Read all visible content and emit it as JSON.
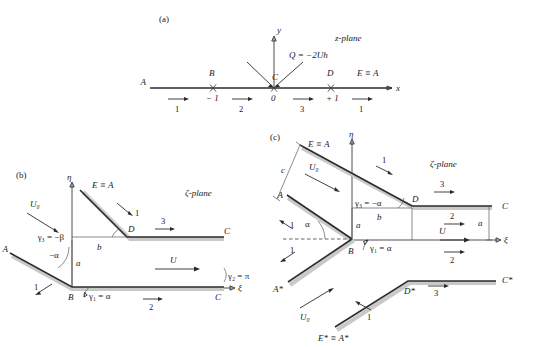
{
  "figure": {
    "panels": [
      {
        "tag": "(a)",
        "plane_label": "z-plane",
        "axes": {
          "x": "x",
          "y": "y"
        },
        "source_label": "Q = −2Uh",
        "points": [
          "A",
          "B",
          "C",
          "D",
          "E ≡ A"
        ],
        "tick_labels": [
          "− 1",
          "0",
          "+ 1"
        ],
        "segment_numbers": [
          "1",
          "2",
          "3",
          "1"
        ]
      },
      {
        "tag": "(b)",
        "plane_label": "ζ-plane",
        "axes": {
          "x": "ξ",
          "y": "η"
        },
        "points": [
          "A",
          "B",
          "C",
          "C",
          "D",
          "E ≡ A"
        ],
        "flow_labels": [
          "U₀",
          "U"
        ],
        "angles": [
          "γ₃ = −β",
          "γ₂ = π",
          "γ₁ = α",
          "−α"
        ],
        "dimensions": [
          "a",
          "b"
        ],
        "segment_numbers": [
          "1",
          "1",
          "2",
          "3"
        ]
      },
      {
        "tag": "(c)",
        "plane_label": "ζ-plane",
        "axes": {
          "x": "ξ",
          "y": "η"
        },
        "points": [
          "A",
          "A*",
          "B",
          "C",
          "C*",
          "D",
          "D*",
          "E ≡ A",
          "E* ≡ A*"
        ],
        "flow_labels": [
          "U₀",
          "U₀",
          "U"
        ],
        "angles": [
          "γ₃ = −α",
          "γ₁ = α",
          "α"
        ],
        "dimensions": [
          "a",
          "a",
          "b",
          "c"
        ],
        "segment_numbers": [
          "1",
          "1",
          "1",
          "1",
          "2",
          "2",
          "3",
          "3"
        ]
      }
    ]
  },
  "colors": {
    "ink": "#1a1a1a",
    "line": "#2b2b2b",
    "band": "#c9c9c9"
  }
}
